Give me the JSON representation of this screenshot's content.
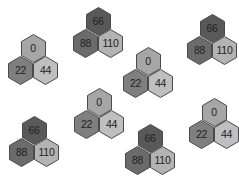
{
  "colors": {
    "background": "#ffffff",
    "stroke": "#4a4a4a",
    "text": "#222222",
    "shade_0": "#a6a6a6",
    "shade_22": "#7f7f7f",
    "shade_44": "#bfbfbf",
    "shade_66": "#595959",
    "shade_88": "#6b6b6b",
    "shade_110": "#b3b3b3"
  },
  "clusters": [
    {
      "x": 8,
      "y": 34,
      "top": "0",
      "bottom_left": "22",
      "bottom_right": "44"
    },
    {
      "x": 73,
      "y": 7,
      "top": "66",
      "bottom_left": "88",
      "bottom_right": "110"
    },
    {
      "x": 123,
      "y": 47,
      "top": "0",
      "bottom_left": "22",
      "bottom_right": "44"
    },
    {
      "x": 187,
      "y": 14,
      "top": "66",
      "bottom_left": "88",
      "bottom_right": "110"
    },
    {
      "x": 9,
      "y": 116,
      "top": "66",
      "bottom_left": "88",
      "bottom_right": "110"
    },
    {
      "x": 74,
      "y": 88,
      "top": "0",
      "bottom_left": "22",
      "bottom_right": "44"
    },
    {
      "x": 125,
      "y": 124,
      "top": "66",
      "bottom_left": "88",
      "bottom_right": "110"
    },
    {
      "x": 189,
      "y": 98,
      "top": "0",
      "bottom_left": "22",
      "bottom_right": "44"
    }
  ]
}
